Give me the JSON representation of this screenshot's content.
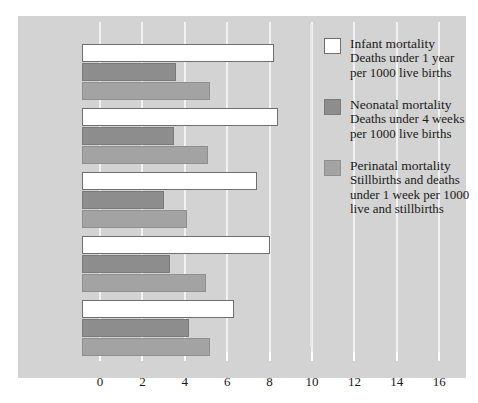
{
  "chart_data": {
    "type": "bar",
    "orientation": "horizontal",
    "title": "",
    "xlabel": "",
    "ylabel": "",
    "xlim": [
      0,
      16.8
    ],
    "xticks": [
      0,
      2,
      4,
      6,
      8,
      10,
      12,
      14,
      16
    ],
    "xtick_labels": [
      "0",
      "2",
      "4",
      "6",
      "8",
      "10",
      "12",
      "14",
      "16"
    ],
    "grid": true,
    "legend_position": "right",
    "categories": [
      "United Kingdom",
      "England",
      "Wales",
      "Scotland",
      "Northern Ireland"
    ],
    "series": [
      {
        "name": "Infant mortality",
        "description": "Deaths under 1 year per 1000 live births",
        "color": "#ffffff",
        "values": [
          8.2,
          8.4,
          7.4,
          8.0,
          6.3
        ]
      },
      {
        "name": "Neonatal mortality",
        "description": "Deaths under 4 weeks per 1000 live births",
        "color": "#8d8d8d",
        "values": [
          3.6,
          3.5,
          3.0,
          3.3,
          4.2
        ]
      },
      {
        "name": "Perinatal mortality",
        "description": "Stillbirths and deaths under 1 week per 1000 live and stillbirths",
        "color": "#a3a3a3",
        "values": [
          5.2,
          5.1,
          4.1,
          5.0,
          5.2
        ]
      }
    ]
  },
  "legend": [
    {
      "swatch": "infant",
      "title": "Infant mortality",
      "description": "Deaths under 1 year\nper 1000 live births"
    },
    {
      "swatch": "neonatal",
      "title": "Neonatal mortality",
      "description": "Deaths under 4 weeks\nper 1000 live births"
    },
    {
      "swatch": "perinatal",
      "title": "Perinatal mortality",
      "description": "Stillbirths and deaths\nunder 1 week per 1000\nlive and stillbirths"
    }
  ],
  "group_labels": [
    "United\nKingdom",
    "England",
    "Wales",
    "Scotland",
    "Northern\nIreland"
  ],
  "colors": {
    "panel_background": "#d3d3d3",
    "page_background": "#ffffff",
    "gridline": "#f2f2f2",
    "text": "#1a1a1a",
    "infant": "#ffffff",
    "neonatal": "#8d8d8d",
    "perinatal": "#a3a3a3"
  }
}
